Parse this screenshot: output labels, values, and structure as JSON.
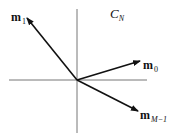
{
  "diagram": {
    "title": "",
    "space_label": {
      "name": "C",
      "subscript": "N"
    },
    "origin": {
      "x": 77,
      "y": 80
    },
    "axes": {
      "horizontal": {
        "x1": 9,
        "x2": 147,
        "y": 80
      },
      "vertical": {
        "x": 77,
        "y1": 9,
        "y2": 133
      },
      "color": "#777777"
    },
    "vectors": [
      {
        "id": "m1",
        "name": "m",
        "subscript": "1",
        "tip": {
          "x": 27,
          "y": 18
        }
      },
      {
        "id": "m0",
        "name": "m",
        "subscript": "0",
        "tip": {
          "x": 140,
          "y": 61
        }
      },
      {
        "id": "mM1",
        "name": "m",
        "subscript": "M−1",
        "tip": {
          "x": 138,
          "y": 111
        }
      }
    ],
    "vector_color": "#111111"
  }
}
